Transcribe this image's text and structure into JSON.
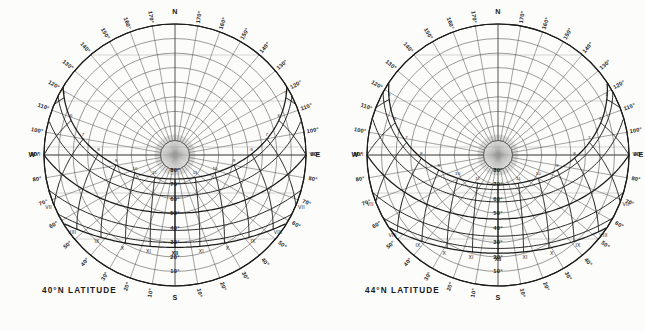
{
  "page": {
    "background_color": "#fcfcfa",
    "ink_color": "#1b1b1b",
    "grid_color": "#4a4a4a",
    "faint_color": "#9a9a9a"
  },
  "charts": [
    {
      "id": "sunpath-40n",
      "caption": "40°N LATITUDE",
      "latitude_deg": 40,
      "cx": 175,
      "cy": 155,
      "r": 131,
      "cardinals": {
        "north": "N",
        "south": "S",
        "east": "E",
        "west": "W"
      },
      "azimuth_labels": [
        "10°",
        "20°",
        "30°",
        "40°",
        "50°",
        "60°",
        "70°",
        "80°",
        "100°",
        "110°",
        "120°",
        "130°",
        "140°",
        "150°",
        "160°",
        "170°"
      ],
      "altitude_labels": [
        "10°",
        "20°",
        "30°",
        "40°",
        "50°",
        "60°",
        "70°",
        "80°"
      ],
      "hour_labels_west": [
        "III",
        "IV",
        "V",
        "VI"
      ],
      "hour_labels_east": [
        "IX",
        "X",
        "XI",
        "XII",
        "VIII",
        "VII",
        "VI"
      ],
      "hour_labels_arabic": [
        "1",
        "2",
        "3",
        "4",
        "5",
        "6",
        "7",
        "8",
        "9",
        "10",
        "11"
      ]
    },
    {
      "id": "sunpath-44n",
      "caption": "44°N LATITUDE",
      "latitude_deg": 44,
      "cx": 175,
      "cy": 155,
      "r": 131,
      "cardinals": {
        "north": "N",
        "south": "S",
        "east": "E",
        "west": "W"
      },
      "azimuth_labels": [
        "10°",
        "20°",
        "30°",
        "40°",
        "50°",
        "60°",
        "70°",
        "80°",
        "100°",
        "110°",
        "120°",
        "130°",
        "140°",
        "150°",
        "160°",
        "170°"
      ],
      "altitude_labels": [
        "10°",
        "20°",
        "30°",
        "40°",
        "50°",
        "60°",
        "70°",
        "80°"
      ],
      "hour_labels_west": [
        "II",
        "III",
        "IV",
        "V",
        "VI"
      ],
      "hour_labels_east": [
        "IX",
        "X",
        "XI",
        "XII",
        "VIII",
        "VII",
        "VI"
      ],
      "hour_labels_arabic": [
        "1",
        "2",
        "3",
        "4",
        "5",
        "6",
        "7",
        "8",
        "9",
        "10",
        "11"
      ]
    }
  ],
  "chart_data": {
    "type": "line",
    "subtitle": "Solar altitude / azimuth charts for two northern latitudes",
    "panels": [
      {
        "name": "40°N LATITUDE",
        "latitude": 40,
        "projection": "equidistant-polar",
        "radial_axis": {
          "label": "Altitude",
          "ticks": [
            0,
            10,
            20,
            30,
            40,
            50,
            60,
            70,
            80,
            90
          ],
          "tick_labels": [
            "0°",
            "10°",
            "20°",
            "30°",
            "40°",
            "50°",
            "60°",
            "70°",
            "80°",
            "90°"
          ],
          "zenith_at_center": true,
          "range": [
            0,
            90
          ]
        },
        "angular_axis": {
          "label": "Azimuth",
          "origin": "S",
          "ticks": [
            0,
            10,
            20,
            30,
            40,
            50,
            60,
            70,
            80,
            90,
            100,
            110,
            120,
            130,
            140,
            150,
            160,
            170,
            180
          ],
          "tick_labels": [
            "S",
            "10°",
            "20°",
            "30°",
            "40°",
            "50°",
            "60°",
            "70°",
            "80°",
            "E/W",
            "100°",
            "110°",
            "120°",
            "130°",
            "140°",
            "150°",
            "160°",
            "170°",
            "N"
          ],
          "range": [
            0,
            360
          ]
        },
        "declination_curves": [
          {
            "name": "Jun 21",
            "declination": 23.5,
            "noon_altitude": 73.5,
            "sunrise_azimuth": 120.5
          },
          {
            "name": "May/Jul",
            "declination": 20.2,
            "noon_altitude": 70.2,
            "sunrise_azimuth": 116.5
          },
          {
            "name": "Apr/Aug",
            "declination": 11.8,
            "noon_altitude": 61.8,
            "sunrise_azimuth": 105.5
          },
          {
            "name": "Mar/Sep 21",
            "declination": 0.0,
            "noon_altitude": 50.0,
            "sunrise_azimuth": 90.0
          },
          {
            "name": "Feb/Oct",
            "declination": -11.8,
            "noon_altitude": 38.2,
            "sunrise_azimuth": 74.5
          },
          {
            "name": "Jan/Nov",
            "declination": -20.2,
            "noon_altitude": 29.8,
            "sunrise_azimuth": 63.5
          },
          {
            "name": "Dec 21",
            "declination": -23.5,
            "noon_altitude": 26.5,
            "sunrise_azimuth": 59.5
          }
        ],
        "hour_lines": [
          {
            "hour": "VI",
            "hour_24": 6
          },
          {
            "hour": "VII",
            "hour_24": 7
          },
          {
            "hour": "VIII",
            "hour_24": 8
          },
          {
            "hour": "IX",
            "hour_24": 9
          },
          {
            "hour": "X",
            "hour_24": 10
          },
          {
            "hour": "XI",
            "hour_24": 11
          },
          {
            "hour": "XII",
            "hour_24": 12
          }
        ],
        "grid": true,
        "legend": "none"
      },
      {
        "name": "44°N LATITUDE",
        "latitude": 44,
        "projection": "equidistant-polar",
        "radial_axis": {
          "label": "Altitude",
          "ticks": [
            0,
            10,
            20,
            30,
            40,
            50,
            60,
            70,
            80,
            90
          ],
          "tick_labels": [
            "0°",
            "10°",
            "20°",
            "30°",
            "40°",
            "50°",
            "60°",
            "70°",
            "80°",
            "90°"
          ],
          "zenith_at_center": true,
          "range": [
            0,
            90
          ]
        },
        "angular_axis": {
          "label": "Azimuth",
          "origin": "S",
          "ticks": [
            0,
            10,
            20,
            30,
            40,
            50,
            60,
            70,
            80,
            90,
            100,
            110,
            120,
            130,
            140,
            150,
            160,
            170,
            180
          ],
          "tick_labels": [
            "S",
            "10°",
            "20°",
            "30°",
            "40°",
            "50°",
            "60°",
            "70°",
            "80°",
            "E/W",
            "100°",
            "110°",
            "120°",
            "130°",
            "140°",
            "150°",
            "160°",
            "170°",
            "N"
          ],
          "range": [
            0,
            360
          ]
        },
        "declination_curves": [
          {
            "name": "Jun 21",
            "declination": 23.5,
            "noon_altitude": 69.5,
            "sunrise_azimuth": 124.0
          },
          {
            "name": "May/Jul",
            "declination": 20.2,
            "noon_altitude": 66.2,
            "sunrise_azimuth": 119.5
          },
          {
            "name": "Apr/Aug",
            "declination": 11.8,
            "noon_altitude": 57.8,
            "sunrise_azimuth": 107.0
          },
          {
            "name": "Mar/Sep 21",
            "declination": 0.0,
            "noon_altitude": 46.0,
            "sunrise_azimuth": 90.0
          },
          {
            "name": "Feb/Oct",
            "declination": -11.8,
            "noon_altitude": 34.2,
            "sunrise_azimuth": 73.0
          },
          {
            "name": "Jan/Nov",
            "declination": -20.2,
            "noon_altitude": 25.8,
            "sunrise_azimuth": 60.5
          },
          {
            "name": "Dec 21",
            "declination": -23.5,
            "noon_altitude": 22.5,
            "sunrise_azimuth": 56.0
          }
        ],
        "hour_lines": [
          {
            "hour": "VI",
            "hour_24": 6
          },
          {
            "hour": "VII",
            "hour_24": 7
          },
          {
            "hour": "VIII",
            "hour_24": 8
          },
          {
            "hour": "IX",
            "hour_24": 9
          },
          {
            "hour": "X",
            "hour_24": 10
          },
          {
            "hour": "XI",
            "hour_24": 11
          },
          {
            "hour": "XII",
            "hour_24": 12
          }
        ],
        "grid": true,
        "legend": "none"
      }
    ]
  }
}
